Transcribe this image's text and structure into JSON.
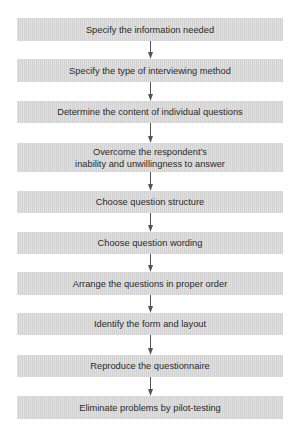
{
  "diagram": {
    "type": "flowchart",
    "direction": "top-to-bottom",
    "colors": {
      "box_fill": "#d9d9d9",
      "text": "#2a2a2a",
      "arrow": "#555555",
      "background": "#ffffff"
    },
    "steps": [
      {
        "label": "Specify the information needed"
      },
      {
        "label": "Specify the type of interviewing method"
      },
      {
        "label": "Determine the content of individual questions"
      },
      {
        "label_line1": "Overcome the respondent’s",
        "label_line2": "inability and unwillingness to answer"
      },
      {
        "label": "Choose question structure"
      },
      {
        "label": "Choose question wording"
      },
      {
        "label": "Arrange the questions in proper order"
      },
      {
        "label": "Identify the form and layout"
      },
      {
        "label": "Reproduce the questionnaire"
      },
      {
        "label": "Eliminate problems by pilot-testing"
      }
    ],
    "connectors": [
      {
        "from": 0,
        "to": 1,
        "icon": "arrow-down-icon"
      },
      {
        "from": 1,
        "to": 2,
        "icon": "arrow-down-icon"
      },
      {
        "from": 2,
        "to": 3,
        "icon": "arrow-down-icon"
      },
      {
        "from": 3,
        "to": 4,
        "icon": "arrow-down-icon"
      },
      {
        "from": 4,
        "to": 5,
        "icon": "arrow-down-icon"
      },
      {
        "from": 5,
        "to": 6,
        "icon": "arrow-down-icon"
      },
      {
        "from": 6,
        "to": 7,
        "icon": "arrow-down-icon"
      },
      {
        "from": 7,
        "to": 8,
        "icon": "arrow-down-icon"
      },
      {
        "from": 8,
        "to": 9,
        "icon": "arrow-down-icon"
      }
    ]
  }
}
